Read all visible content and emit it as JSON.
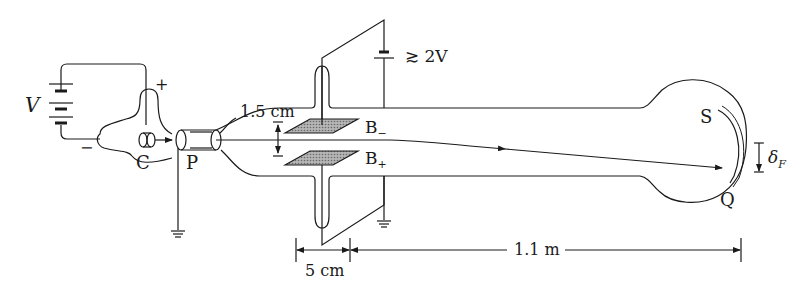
{
  "labels": {
    "battery_voltage": "V",
    "plus_sign": "+",
    "minus_sign": "−",
    "cathode": "C",
    "anode": "P",
    "plate_gap": "1.5 cm",
    "plate_upper": "B",
    "plate_upper_sub": "−",
    "plate_lower": "B",
    "plate_lower_sub": "+",
    "plate_voltage": "≳ 2V",
    "screen_top": "S",
    "screen_point": "Q",
    "deflection": "δ",
    "deflection_sub": "F",
    "plate_length": "5 cm",
    "drift_length": "1.1 m"
  },
  "colors": {
    "line": "#1a1a1a",
    "plate_fill": "#9a9a9a",
    "background": "#ffffff"
  }
}
